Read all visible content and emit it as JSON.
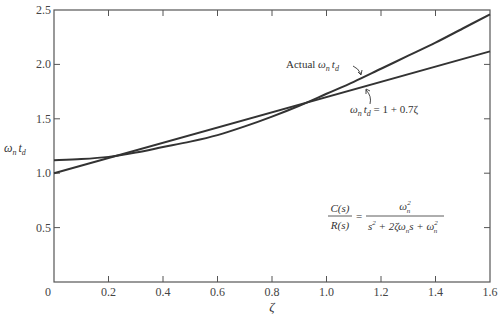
{
  "chart_data": {
    "type": "line",
    "title": "",
    "xlabel": "ζ",
    "ylabel": "ωn td",
    "xlim": [
      0,
      1.6
    ],
    "ylim": [
      0,
      2.5
    ],
    "xticks": [
      0,
      0.2,
      0.4,
      0.6,
      0.8,
      1.0,
      1.2,
      1.4,
      1.6
    ],
    "xtick_labels": [
      "0",
      "0.2",
      "0.4",
      "0.6",
      "0.8",
      "1.0",
      "1.2",
      "1.4",
      "1.6"
    ],
    "yticks": [
      0.5,
      1.0,
      1.5,
      2.0,
      2.5
    ],
    "ytick_labels": [
      "0.5",
      "1.0",
      "1.5",
      "2.0",
      "2.5"
    ],
    "grid": false,
    "series": [
      {
        "name": "Actual ωn td",
        "x": [
          0,
          0.1,
          0.2,
          0.3,
          0.4,
          0.5,
          0.6,
          0.7,
          0.8,
          0.9,
          1.0,
          1.1,
          1.2,
          1.3,
          1.4,
          1.5,
          1.6
        ],
        "y": [
          1.12,
          1.13,
          1.15,
          1.19,
          1.24,
          1.29,
          1.35,
          1.43,
          1.52,
          1.62,
          1.73,
          1.84,
          1.96,
          2.08,
          2.2,
          2.33,
          2.46
        ]
      },
      {
        "name": "ωn td = 1 + 0.7ζ",
        "x": [
          0,
          1.6
        ],
        "y": [
          1.0,
          2.12
        ]
      }
    ],
    "annotations": [
      {
        "text": "Actual ωn td",
        "points_to": "Actual ωn td"
      },
      {
        "text": "ωn td = 1 + 0.7ζ",
        "points_to": "ωn td = 1 + 0.7ζ"
      },
      {
        "text": "C(s)/R(s) = ωn² / (s² + 2ζωn s + ωn²)"
      }
    ]
  },
  "labels": {
    "xlabel": "ζ",
    "ylabel_main": "ω",
    "ylabel_sub1": "n",
    "ylabel_t": "t",
    "ylabel_sub2": "d",
    "origin": "0",
    "actual_prefix": "Actual ",
    "omega": "ω",
    "sub_n": "n",
    "t": "t",
    "sub_d": "d",
    "approx_rhs": " = 1 + 0.7ζ",
    "tf_num_left": "C(s)",
    "tf_den_left": "R(s)",
    "equals": "=",
    "tf_num_right": "ω",
    "tf_den_right_a": "s",
    "tf_den_right_b": " + 2ζω",
    "tf_den_right_c": "s + ω",
    "sup2": "2"
  }
}
